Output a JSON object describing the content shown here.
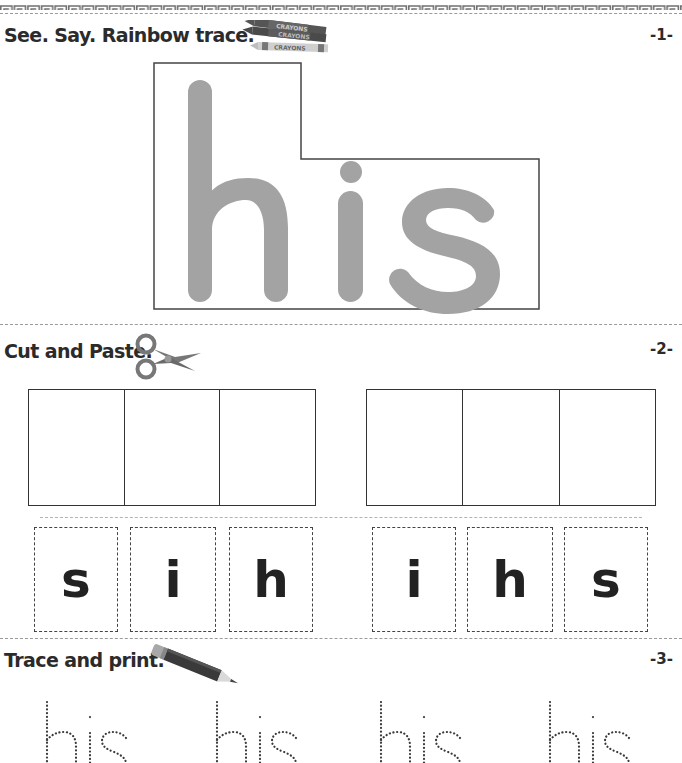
{
  "worksheet": {
    "word": "his",
    "colors": {
      "text": "#2b2b2b",
      "rainbow_letters": "#a3a3a3",
      "border_pattern": "#707070",
      "dashed_divider": "#9a9a9a"
    }
  },
  "section1": {
    "heading": "See. Say. Rainbow trace.",
    "number": "-1-",
    "icon": "crayons-icon",
    "crayon_label": "CRAYONS",
    "letters": [
      "h",
      "i",
      "s"
    ]
  },
  "section2": {
    "heading": "Cut and Paste.",
    "number": "-2-",
    "icon": "scissors-icon",
    "paste_boxes": [
      {
        "cells": [
          "",
          "",
          ""
        ]
      },
      {
        "cells": [
          "",
          "",
          ""
        ]
      }
    ],
    "cut_tiles": [
      {
        "letters": [
          "s",
          "i",
          "h"
        ]
      },
      {
        "letters": [
          "i",
          "h",
          "s"
        ]
      }
    ]
  },
  "section3": {
    "heading": "Trace and print.",
    "number": "-3-",
    "icon": "pencil-icon",
    "trace_words": [
      "his",
      "his",
      "his",
      "his"
    ]
  }
}
